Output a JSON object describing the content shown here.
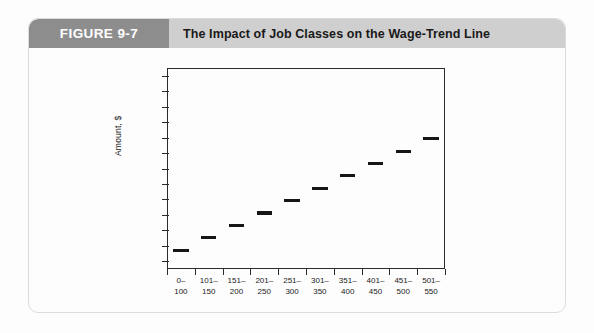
{
  "figure": {
    "label": "FIGURE 9-7",
    "title": "The Impact of Job Classes on the Wage-Trend Line",
    "label_bg": "#8d8d8d",
    "title_bg": "#cfcfcf",
    "card_bg": "#fdfdfd"
  },
  "chart_data": {
    "type": "bar",
    "title": "The Impact of Job Classes on the Wage-Trend Line",
    "xlabel": "",
    "ylabel": "Amount, $",
    "grid": false,
    "legend": null,
    "note": "Step/stairstep chart: each job class range is drawn as a flat horizontal segment whose height rises evenly from class to class, forming a stepped wage-trend line.",
    "categories": [
      "0-\n100",
      "101-\n150",
      "151-\n200",
      "201-\n250",
      "251-\n300",
      "301-\n350",
      "351-\n400",
      "401-\n450",
      "451-\n500",
      "501-\n550"
    ],
    "category_lines": [
      [
        "0–",
        "100"
      ],
      [
        "101–",
        "150"
      ],
      [
        "151–",
        "200"
      ],
      [
        "201–",
        "250"
      ],
      [
        "251–",
        "300"
      ],
      [
        "301–",
        "350"
      ],
      [
        "351–",
        "400"
      ],
      [
        "401–",
        "450"
      ],
      [
        "451–",
        "500"
      ],
      [
        "501–",
        "550"
      ]
    ],
    "values": [
      1,
      2,
      3,
      4,
      5,
      6,
      7,
      8,
      9,
      10
    ],
    "ylim": [
      0,
      13
    ],
    "xlim": [
      0,
      10
    ],
    "y_tick_count": 13,
    "y_tick_labels": []
  }
}
